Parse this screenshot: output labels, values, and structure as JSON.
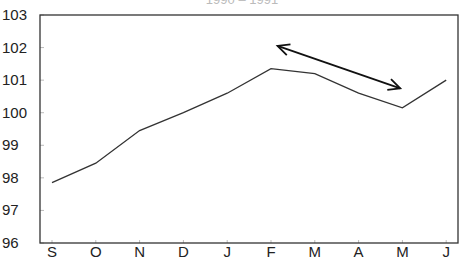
{
  "chart_data": {
    "type": "line",
    "title": "1990 – 1991",
    "xlabel": "",
    "ylabel": "",
    "categories": [
      "S",
      "O",
      "N",
      "D",
      "J",
      "F",
      "M",
      "A",
      "M",
      "J"
    ],
    "series": [
      {
        "name": "index",
        "values": [
          97.85,
          98.45,
          99.45,
          100.0,
          100.6,
          101.35,
          101.2,
          100.6,
          100.15,
          101.0
        ]
      }
    ],
    "ylim": [
      96,
      103
    ],
    "yticks": [
      96,
      97,
      98,
      99,
      100,
      101,
      102,
      103
    ],
    "grid": false,
    "legend": "none",
    "annotations": [
      {
        "type": "double-arrow",
        "from": {
          "x_index": 5.15,
          "y": 102.05
        },
        "to": {
          "x_index": 7.95,
          "y": 100.75
        }
      }
    ],
    "colors": {
      "line": "#333333",
      "axis": "#333333",
      "arrow": "#111111"
    }
  }
}
